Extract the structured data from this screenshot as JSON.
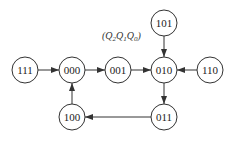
{
  "diagram": {
    "title": "(Q2Q1Q0)",
    "title_parts": [
      "(",
      "Q",
      "2",
      "Q",
      "1",
      "Q",
      "0",
      ")"
    ],
    "nodes": [
      {
        "id": "111",
        "label": "111",
        "x": 25,
        "y": 70
      },
      {
        "id": "000",
        "label": "000",
        "x": 72,
        "y": 70
      },
      {
        "id": "001",
        "label": "001",
        "x": 118,
        "y": 70
      },
      {
        "id": "010",
        "label": "010",
        "x": 164,
        "y": 70
      },
      {
        "id": "110",
        "label": "110",
        "x": 210,
        "y": 70
      },
      {
        "id": "101",
        "label": "101",
        "x": 164,
        "y": 23
      },
      {
        "id": "011",
        "label": "011",
        "x": 164,
        "y": 117
      },
      {
        "id": "100",
        "label": "100",
        "x": 72,
        "y": 117
      }
    ],
    "edges": [
      {
        "from": "111",
        "to": "000"
      },
      {
        "from": "000",
        "to": "001"
      },
      {
        "from": "001",
        "to": "010"
      },
      {
        "from": "110",
        "to": "010"
      },
      {
        "from": "101",
        "to": "010"
      },
      {
        "from": "010",
        "to": "011"
      },
      {
        "from": "011",
        "to": "100"
      },
      {
        "from": "100",
        "to": "000"
      }
    ]
  }
}
